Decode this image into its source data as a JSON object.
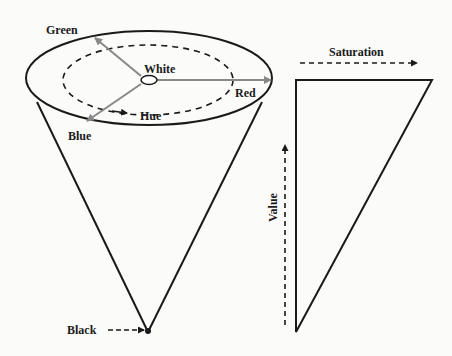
{
  "diagram": {
    "cone": {
      "labels": {
        "green": "Green",
        "white": "White",
        "red": "Red",
        "hue": "Hue",
        "blue": "Blue",
        "black": "Black"
      }
    },
    "triangle": {
      "labels": {
        "saturation": "Saturation",
        "value": "Value"
      }
    },
    "colors": {
      "stroke": "#1a1a1a",
      "arrow": "#888888",
      "background": "#fbfbf9"
    }
  }
}
